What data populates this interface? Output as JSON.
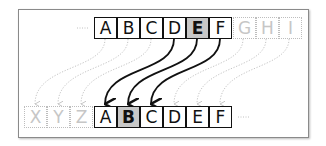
{
  "diagram": {
    "type": "array-shift-illustration",
    "top_row": {
      "leading_ellipsis": "····",
      "cells": [
        {
          "label": "A",
          "style": "solid"
        },
        {
          "label": "B",
          "style": "solid"
        },
        {
          "label": "C",
          "style": "solid"
        },
        {
          "label": "D",
          "style": "solid"
        },
        {
          "label": "E",
          "style": "highlighted"
        },
        {
          "label": "F",
          "style": "solid"
        },
        {
          "label": "G",
          "style": "ghost"
        },
        {
          "label": "H",
          "style": "ghost"
        },
        {
          "label": "I",
          "style": "ghost"
        }
      ]
    },
    "bottom_row": {
      "trailing_ellipsis": "····",
      "cells": [
        {
          "label": "X",
          "style": "ghost"
        },
        {
          "label": "Y",
          "style": "ghost"
        },
        {
          "label": "Z",
          "style": "ghost"
        },
        {
          "label": "A",
          "style": "solid"
        },
        {
          "label": "B",
          "style": "highlighted"
        },
        {
          "label": "C",
          "style": "solid"
        },
        {
          "label": "D",
          "style": "solid"
        },
        {
          "label": "E",
          "style": "solid"
        },
        {
          "label": "F",
          "style": "solid"
        }
      ]
    },
    "arrows": {
      "solid": [
        {
          "from": "D",
          "to": "A"
        },
        {
          "from": "E",
          "to": "B"
        },
        {
          "from": "F",
          "to": "C"
        }
      ],
      "dotted_shift": 3
    },
    "colors": {
      "stroke": "#111111",
      "highlight": "#c8c8c8",
      "ghost": "#c6c6c6",
      "frame": "#8a8a8a"
    }
  }
}
